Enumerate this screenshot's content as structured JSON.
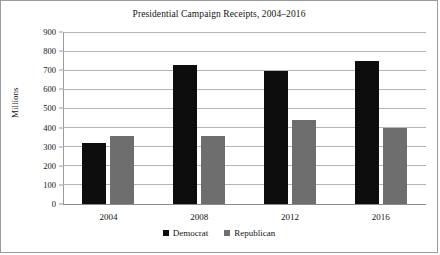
{
  "chart_data": {
    "type": "bar",
    "title": "Presidential Campaign Receipts, 2004–2016",
    "xlabel": "",
    "ylabel": "Millions",
    "categories": [
      "2004",
      "2008",
      "2012",
      "2016"
    ],
    "series": [
      {
        "name": "Democrat",
        "color": "#0d0d0d",
        "values": [
          320,
          727,
          698,
          748
        ]
      },
      {
        "name": "Republican",
        "color": "#6e6e6e",
        "values": [
          357,
          354,
          438,
          396
        ]
      }
    ],
    "ylim": [
      0,
      900
    ],
    "ytick_step": 100,
    "yticks": [
      0,
      100,
      200,
      300,
      400,
      500,
      600,
      700,
      800,
      900
    ],
    "ytick_labels": [
      "0",
      "100",
      "200",
      "300",
      "400",
      "500",
      "600",
      "700",
      "800",
      "900"
    ],
    "grid": "horizontal",
    "legend_position": "bottom-center",
    "legend_entries": [
      "Democrat",
      "Republican"
    ],
    "annotations": []
  },
  "legend": {
    "items": [
      {
        "label": "Democrat",
        "swatch": "black-square-icon"
      },
      {
        "label": "Republican",
        "swatch": "gray-square-icon"
      }
    ]
  }
}
